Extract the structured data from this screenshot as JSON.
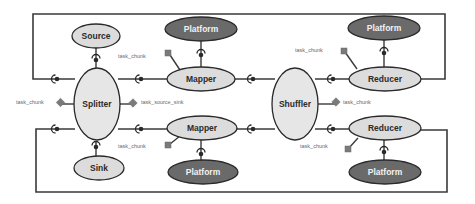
{
  "diagram": {
    "title": "",
    "colors": {
      "edge": "#3a3a3a",
      "component_fill": "#dcdcdc",
      "platform_fill": "#6a6a6a",
      "port_fill": "#7a7a7a",
      "label_text": "#6a6a6a"
    },
    "nodes": {
      "source": "Source",
      "sink": "Sink",
      "splitter": "Splitter",
      "mapper_top": "Mapper",
      "mapper_bottom": "Mapper",
      "shuffler": "Shuffler",
      "reducer_top": "Reducer",
      "reducer_bottom": "Reducer",
      "platform_mapper_top": "Platform",
      "platform_mapper_bottom": "Platform",
      "platform_reducer_top": "Platform",
      "platform_reducer_bottom": "Platform"
    },
    "port_labels": {
      "source_task_chunk": "task_chunk",
      "sink_task_chunk": "task_chunk",
      "splitter_left": "task_chunk",
      "splitter_right": "task_source_sink",
      "mapper_top": "task_chunk",
      "mapper_bottom": "task_chunk",
      "shuffler": "task_chunk",
      "reducer_top": "task_chunk",
      "reducer_bottom": "task_chunk"
    }
  }
}
